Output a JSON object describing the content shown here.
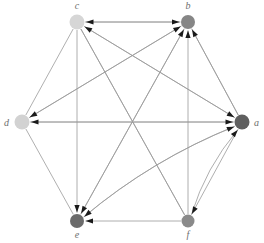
{
  "diagram": {
    "type": "directed-graph",
    "background_color": "#ffffff",
    "edge_color": "#9a9a9a",
    "arrow_color": "#1a1a1a",
    "label_color": "#6e6e6e",
    "nodes": [
      {
        "id": "a",
        "label": "a",
        "x": 242,
        "y": 122,
        "r": 7.5,
        "color": "#5f5f5f",
        "label_x": 254,
        "label_y": 126
      },
      {
        "id": "b",
        "label": "b",
        "x": 188,
        "y": 22,
        "r": 7,
        "color": "#868686",
        "label_x": 188,
        "label_y": 9
      },
      {
        "id": "c",
        "label": "c",
        "x": 77,
        "y": 22,
        "r": 7.5,
        "color": "#d6d6d6",
        "label_x": 77,
        "label_y": 9
      },
      {
        "id": "d",
        "label": "d",
        "x": 22,
        "y": 122,
        "r": 7.5,
        "color": "#d2d2d2",
        "label_x": 9,
        "label_y": 126
      },
      {
        "id": "e",
        "label": "e",
        "x": 77,
        "y": 221,
        "r": 7,
        "color": "#6b6b6b",
        "label_x": 77,
        "label_y": 238
      },
      {
        "id": "f",
        "label": "f",
        "x": 188,
        "y": 221,
        "r": 6.5,
        "color": "#8a8a8a",
        "label_x": 188,
        "label_y": 238
      }
    ],
    "edges": [
      {
        "from": "d",
        "to": "a",
        "curve": 0,
        "arrow": true
      },
      {
        "from": "d",
        "to": "c",
        "curve": 0,
        "arrow": false
      },
      {
        "from": "d",
        "to": "e",
        "curve": 0,
        "arrow": false
      },
      {
        "from": "d",
        "to": "b",
        "curve": 0,
        "arrow": true
      },
      {
        "from": "c",
        "to": "a",
        "curve": 0,
        "arrow": true
      },
      {
        "from": "c",
        "to": "b",
        "curve": 0,
        "arrow": true
      },
      {
        "from": "c",
        "to": "e",
        "curve": 0,
        "arrow": true
      },
      {
        "from": "c",
        "to": "f",
        "curve": 0,
        "arrow": false
      },
      {
        "from": "b",
        "to": "c",
        "curve": 0,
        "arrow": true
      },
      {
        "from": "b",
        "to": "d",
        "curve": 0,
        "arrow": true
      },
      {
        "from": "b",
        "to": "e",
        "curve": 0,
        "arrow": true
      },
      {
        "from": "b",
        "to": "a",
        "curve": 0,
        "arrow": false
      },
      {
        "from": "a",
        "to": "c",
        "curve": 0,
        "arrow": true
      },
      {
        "from": "a",
        "to": "b",
        "curve": 0,
        "arrow": true
      },
      {
        "from": "a",
        "to": "d",
        "curve": 0,
        "arrow": true
      },
      {
        "from": "a",
        "to": "e",
        "curve": 14,
        "arrow": true
      },
      {
        "from": "e",
        "to": "a",
        "curve": -14,
        "arrow": true
      },
      {
        "from": "e",
        "to": "b",
        "curve": 0,
        "arrow": true
      },
      {
        "from": "f",
        "to": "e",
        "curve": 0,
        "arrow": true
      },
      {
        "from": "f",
        "to": "b",
        "curve": 0,
        "arrow": true
      },
      {
        "from": "f",
        "to": "a",
        "curve": -10,
        "arrow": true
      },
      {
        "from": "f",
        "to": "c",
        "curve": 0,
        "arrow": false
      },
      {
        "from": "a",
        "to": "f",
        "curve": 0,
        "arrow": true
      }
    ],
    "node_count": 6,
    "edge_count": 23
  }
}
